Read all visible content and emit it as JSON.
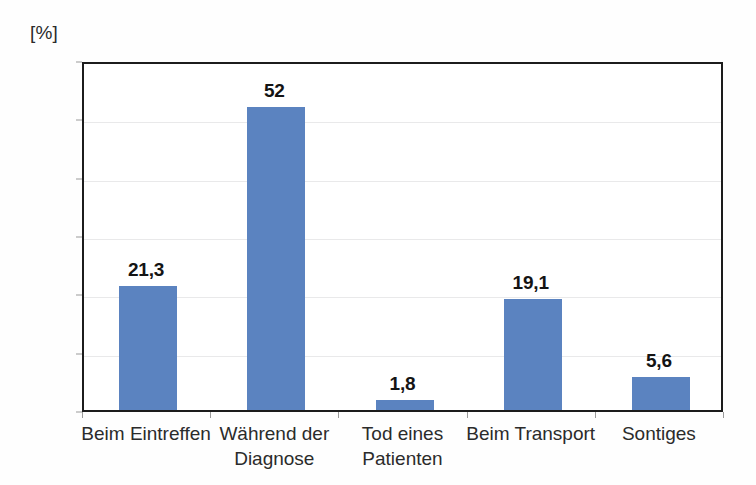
{
  "chart_data": {
    "type": "bar",
    "title": "",
    "subtitle": "",
    "xlabel": "",
    "ylabel": "[%]",
    "unit_label": "[%]",
    "ylim": [
      0,
      60
    ],
    "ytick_step": 10,
    "yticks": [
      0,
      10,
      20,
      30,
      40,
      50,
      60
    ],
    "ytick_labels": [
      "0",
      "10",
      "20",
      "30",
      "40",
      "50",
      "60"
    ],
    "grid": true,
    "grid_axis": "y",
    "legend": false,
    "legend_position": "none",
    "categories": [
      "Beim Eintreffen",
      "Während der Diagnose",
      "Tod eines Patienten",
      "Beim Transport",
      "Sontiges"
    ],
    "category_lines": [
      [
        "Beim Eintreffen"
      ],
      [
        "Während der",
        "Diagnose"
      ],
      [
        "Tod eines",
        "Patienten"
      ],
      [
        "Beim Transport"
      ],
      [
        "Sontiges"
      ]
    ],
    "values": [
      21.3,
      52,
      1.8,
      19.1,
      5.6
    ],
    "value_labels": [
      "21,3",
      "52",
      "1,8",
      "19,1",
      "5,6"
    ],
    "series": [
      {
        "name": "",
        "values": [
          21.3,
          52,
          1.8,
          19.1,
          5.6
        ],
        "color": "#5b83c0"
      }
    ],
    "colors": {
      "bar": "#5b83c0",
      "bar_light": "#6b8fc7",
      "axis": "#1c1c1c",
      "gridline": "#e9e9ea",
      "text": "#2b2b2b",
      "value_text": "#141414",
      "background": "#ffffff"
    }
  }
}
